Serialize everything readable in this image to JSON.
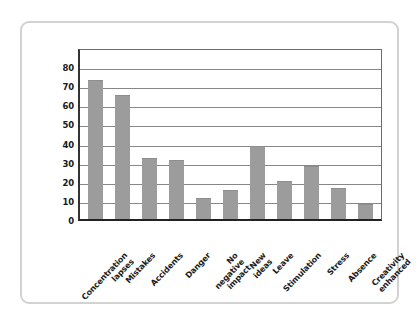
{
  "chart_data": {
    "type": "bar",
    "title": "",
    "xlabel": "",
    "ylabel": "",
    "ylim": [
      0,
      90
    ],
    "yticks": [
      0,
      10,
      20,
      30,
      40,
      50,
      60,
      70,
      80
    ],
    "grid": true,
    "legend": false,
    "bar_color": "#9c9c9c",
    "categories": [
      "Concentration lapses",
      "Mistakes",
      "Accidents",
      "Danger",
      "No negative impact",
      "New ideas",
      "Leave",
      "Stimulation",
      "Stress",
      "Absence",
      "Creativity enhanced"
    ],
    "category_lines": [
      "Concentration\nlapses",
      "Mistakes",
      "Accidents",
      "Danger",
      "No negative\nimpact",
      "New ideas",
      "Leave",
      "Stimulation",
      "Stress",
      "Absence",
      "Creativity\nenhanced"
    ],
    "values": [
      73,
      65,
      32,
      31,
      11,
      15,
      38,
      20,
      28,
      16,
      8
    ]
  },
  "frame": {
    "border_color": "#d2d2d2",
    "background": "#ffffff"
  }
}
